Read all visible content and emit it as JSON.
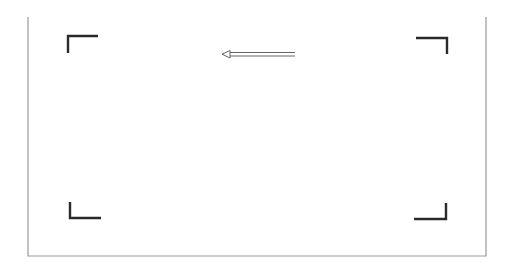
{
  "frame": {
    "border_color": "#9a9a9a",
    "left": 28,
    "top": 17,
    "right": 486,
    "bottom": 256
  },
  "brackets": {
    "color": "#2a2a2a",
    "items": [
      {
        "name": "top-left",
        "points": "68,53 68,36 98,36"
      },
      {
        "name": "top-right",
        "points": "416,38 447,38 447,54"
      },
      {
        "name": "bottom-left",
        "points": "70,202 70,218 101,218"
      },
      {
        "name": "bottom-right",
        "points": "414,219 446,219 446,203"
      }
    ]
  },
  "arrow": {
    "direction": "left",
    "color": "#555555",
    "x_start": 295,
    "x_end": 222,
    "y": 54
  }
}
